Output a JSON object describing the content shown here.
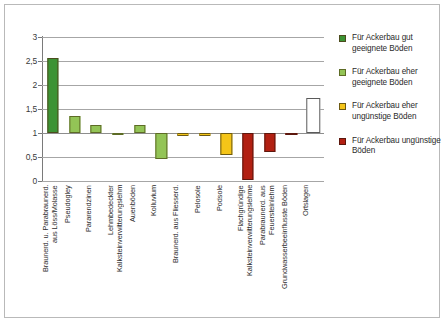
{
  "chart_data": {
    "type": "bar",
    "title": "",
    "xlabel": "",
    "ylabel": "",
    "ylim": [
      0,
      3
    ],
    "ytick_labels": [
      "3",
      "2,5",
      "2",
      "1,5",
      "1",
      "0,5",
      "0"
    ],
    "ytick_values": [
      3,
      2.5,
      2,
      1.5,
      1,
      0.5,
      0
    ],
    "grid": true,
    "baseline": 1,
    "legend_position": "right",
    "categories": [
      "Braunerd. u. Parabraunerd.\naus Löss/Molasse",
      "Pseudogley",
      "Pararendzinen",
      "Lehmbedeckter\nKalksteinverwitterungslehm",
      "Auenböden",
      "Kolluvium",
      "Braunerd. aus Fliesserd.",
      "Pelosole",
      "Podsole",
      "Flachgründige\nKalksteinverwitterungslehme",
      "Parabraunerd. aus\nFeuersteinlehm",
      "Grundwasserbeeinflusste Böden",
      "Ortslagen"
    ],
    "values": [
      2.56,
      1.35,
      1.17,
      0.98,
      1.16,
      0.46,
      0.94,
      0.94,
      0.55,
      0.02,
      0.6,
      0.97,
      1.73
    ],
    "point_classes": [
      "gut-geeignet",
      "eher-geeignet",
      "eher-geeignet",
      "eher-geeignet",
      "eher-geeignet",
      "eher-geeignet",
      "eher-unguenstig",
      "eher-unguenstig",
      "eher-unguenstig",
      "unguenstig",
      "unguenstig",
      "unguenstig",
      "ortslagen"
    ]
  },
  "legend": {
    "items": [
      {
        "label": "Für Ackerbau gut geeignete Böden",
        "key": "gut-geeignet",
        "color": "#3c9334",
        "border": "#4c4c1e"
      },
      {
        "label": "Für Ackerbau eher geeignete Böden",
        "key": "eher-geeignet",
        "color": "#93c456",
        "border": "#5d6b26"
      },
      {
        "label": "Für Ackerbau eher ungünstige Böden",
        "key": "eher-unguenstig",
        "color": "#f5c518",
        "border": "#6d5a12"
      },
      {
        "label": "Für Ackerbau ungünstige Böden",
        "key": "unguenstig",
        "color": "#b22012",
        "border": "#5c170d"
      }
    ]
  },
  "colors": {
    "gut-geeignet": "#3c9334",
    "eher-geeignet": "#93c456",
    "eher-unguenstig": "#f5c518",
    "unguenstig": "#b22012",
    "ortslagen": "#ffffff",
    "gridline": "#a6a6a6",
    "axis": "#7a7a7a",
    "frame": "#b9b9b9"
  }
}
